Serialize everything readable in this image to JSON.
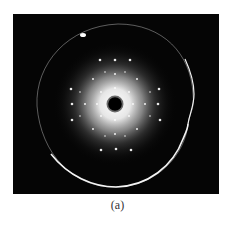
{
  "figure": {
    "caption": "(a)",
    "panel": {
      "type": "diffraction-pattern",
      "background_color": "#050505",
      "glow_color": "#ffffff",
      "ring_color": "#e8e8e8"
    }
  }
}
